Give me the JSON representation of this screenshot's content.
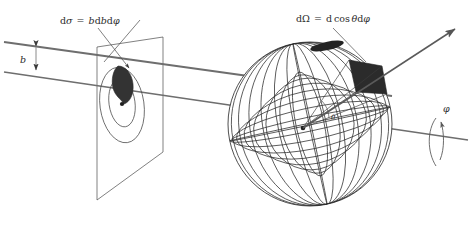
{
  "figure": {
    "background_color": "#ffffff",
    "line_color": "#3a3a3a",
    "beam_color": "#636363",
    "patch_color": "#2e2e2e",
    "width": 476,
    "height": 230
  },
  "labels": {
    "cross_section": {
      "text": "dσ = b db dφ",
      "parts": {
        "d1": "d",
        "sigma": "σ",
        "eq": "=",
        "b1": "b",
        "d2": "d",
        "b2": "b",
        "d3": "d",
        "phi": "φ"
      }
    },
    "solid_angle": {
      "text": "dΩ = d cos θ dφ",
      "parts": {
        "d1": "d",
        "omega": "Ω",
        "eq": "=",
        "d2": "d",
        "cos": "cos",
        "theta": "θ",
        "d3": "d",
        "phi": "φ"
      }
    },
    "impact_parameter": {
      "text": "b"
    },
    "scattering_angle": {
      "text": "θ"
    },
    "azimuthal_angle": {
      "text": "φ"
    }
  },
  "elements": {
    "beam_upper": "incoming-beam-upper-line",
    "beam_lower": "incoming-beam-lower-line",
    "impact_bracket": "impact-parameter-bracket",
    "target_plane": "impact-parameter-plane",
    "ring_outer": "annulus-outer-ellipse",
    "ring_inner": "annulus-inner-ellipse",
    "cross_section_patch": "cross-section-area-element",
    "beam_axis_dot": "beam-axis-center-dot",
    "sphere": "unit-sphere-wireframe",
    "solid_angle_patch": "solid-angle-area-element",
    "scatter_vertex": "scattering-center-vertex",
    "outgoing_ray": "outgoing-scattered-ray",
    "phi_axis": "azimuthal-rotation-axis",
    "phi_arrow": "azimuthal-rotation-arrow",
    "leader_cross_section": "cross-section-leader-arrow",
    "leader_solid_angle": "solid-angle-leader-line"
  }
}
